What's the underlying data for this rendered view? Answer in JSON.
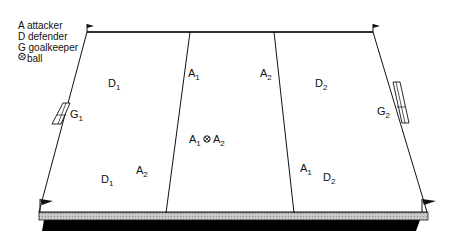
{
  "legend": {
    "items": [
      {
        "symbol": "A",
        "label": "attacker"
      },
      {
        "symbol": "D",
        "label": "defender"
      },
      {
        "symbol": "G",
        "label": "goalkeeper"
      },
      {
        "symbol": "ball-icon",
        "label": "ball"
      }
    ],
    "line0": "A attacker",
    "line1": "D defender",
    "line2": "G goalkeeper",
    "line3": "ball"
  },
  "players": {
    "d1_top": {
      "letter": "D",
      "sub": "1"
    },
    "g1": {
      "letter": "G",
      "sub": "1"
    },
    "a1_top": {
      "letter": "A",
      "sub": "1"
    },
    "a2_top": {
      "letter": "A",
      "sub": "2"
    },
    "d2_top": {
      "letter": "D",
      "sub": "2"
    },
    "g2": {
      "letter": "G",
      "sub": "2"
    },
    "a1_center": {
      "letter": "A",
      "sub": "1"
    },
    "a2_center": {
      "letter": "A",
      "sub": "2"
    },
    "d1_bottom": {
      "letter": "D",
      "sub": "1"
    },
    "a2_bottom": {
      "letter": "A",
      "sub": "2"
    },
    "a1_bottom": {
      "letter": "A",
      "sub": "1"
    },
    "d2_bottom": {
      "letter": "D",
      "sub": "2"
    }
  },
  "colors": {
    "line": "#111111",
    "edge_band": "#b8b8b8",
    "shadow": "#000000"
  }
}
